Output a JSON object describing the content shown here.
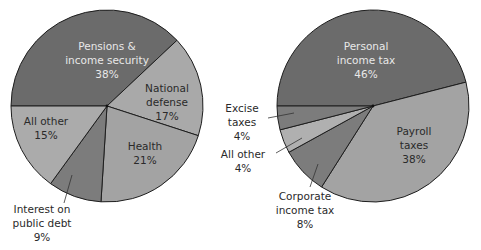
{
  "chart_data": [
    {
      "type": "pie",
      "title": "",
      "start_angle_deg": 270,
      "direction": "clockwise",
      "center": [
        107,
        106
      ],
      "radius": 96,
      "slices": [
        {
          "label_lines": [
            "Pensions &",
            "income security",
            "38%"
          ],
          "name": "Pensions & income security",
          "value": 38,
          "color": "#6b6b6b",
          "text": "light",
          "label_pos": [
            107,
            50
          ]
        },
        {
          "label_lines": [
            "National",
            "defense",
            "17%"
          ],
          "name": "National defense",
          "value": 17,
          "color": "#a9a9a9",
          "text": "dark",
          "label_pos": [
            167,
            92
          ]
        },
        {
          "label_lines": [
            "Health",
            "21%"
          ],
          "name": "Health",
          "value": 21,
          "color": "#a3a3a3",
          "text": "dark",
          "label_pos": [
            145,
            150
          ]
        },
        {
          "label_lines": [
            "Interest on",
            "public debt",
            "9%"
          ],
          "name": "Interest on public debt",
          "value": 9,
          "color": "#7c7c7c",
          "text": "dark",
          "label_pos": [
            42,
            213
          ],
          "leader": [
            [
              72,
              175
            ],
            [
              64,
              203
            ]
          ]
        },
        {
          "label_lines": [
            "All other",
            "15%"
          ],
          "name": "All other",
          "value": 15,
          "color": "#ababab",
          "text": "dark",
          "label_pos": [
            46,
            125
          ]
        }
      ]
    },
    {
      "type": "pie",
      "title": "",
      "start_angle_deg": 270,
      "direction": "clockwise",
      "center": [
        373,
        106
      ],
      "radius": 96,
      "slices": [
        {
          "label_lines": [
            "Personal",
            "income tax",
            "46%"
          ],
          "name": "Personal income tax",
          "value": 46,
          "color": "#6b6b6b",
          "text": "light",
          "label_pos": [
            366,
            50
          ]
        },
        {
          "label_lines": [
            "Payroll",
            "taxes",
            "38%"
          ],
          "name": "Payroll taxes",
          "value": 38,
          "color": "#a3a3a3",
          "text": "dark",
          "label_pos": [
            414,
            135
          ]
        },
        {
          "label_lines": [
            "Corporate",
            "income tax",
            "8%"
          ],
          "name": "Corporate income tax",
          "value": 8,
          "color": "#7c7c7c",
          "text": "dark",
          "label_pos": [
            305,
            200
          ],
          "leader": [
            [
              318,
              164
            ],
            [
              310,
              187
            ]
          ]
        },
        {
          "label_lines": [
            "All other",
            "4%"
          ],
          "name": "All other",
          "value": 4,
          "color": "#b0b0b0",
          "text": "dark",
          "label_pos": [
            243,
            158
          ],
          "leader": [
            [
              302,
              138
            ],
            [
              276,
              153
            ]
          ]
        },
        {
          "label_lines": [
            "Excise",
            "taxes",
            "4%"
          ],
          "name": "Excise taxes",
          "value": 4,
          "color": "#7c7c7c",
          "text": "dark",
          "label_pos": [
            242,
            112
          ],
          "leader": [
            [
              294,
              113
            ],
            [
              268,
              118
            ]
          ]
        }
      ]
    }
  ]
}
